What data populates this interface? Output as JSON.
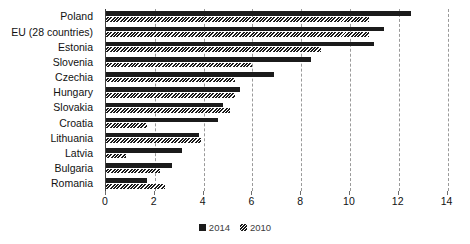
{
  "chart_data": {
    "type": "bar",
    "orientation": "horizontal",
    "title": "",
    "subtitle": "",
    "xlabel": "",
    "ylabel": "",
    "xlim": [
      0,
      14
    ],
    "xticks": [
      0,
      2,
      4,
      6,
      8,
      10,
      12,
      14
    ],
    "xtick_labels": [
      "0",
      "2",
      "4",
      "6",
      "8",
      "10",
      "12",
      "14"
    ],
    "grid": "vertical-dashed",
    "legend_position": "bottom-center",
    "categories": [
      "Poland",
      "EU (28 countries)",
      "Estonia",
      "Slovenia",
      "Czechia",
      "Hungary",
      "Slovakia",
      "Croatia",
      "Lithuania",
      "Latvia",
      "Bulgaria",
      "Romania"
    ],
    "series": [
      {
        "name": "2014",
        "color": "#1b1b1b",
        "values": [
          12.5,
          11.4,
          11.0,
          8.4,
          6.9,
          5.5,
          4.8,
          4.6,
          3.8,
          3.1,
          2.7,
          1.7
        ]
      },
      {
        "name": "2010",
        "color": "#2a2a2a",
        "pattern": "hatched",
        "values": [
          10.8,
          10.8,
          8.8,
          6.0,
          5.3,
          5.3,
          5.1,
          1.7,
          3.9,
          0.8,
          2.2,
          2.4
        ]
      }
    ]
  },
  "legend": {
    "items": [
      {
        "label": "2014",
        "swatch": "solid-black-square"
      },
      {
        "label": "2010",
        "swatch": "hatched-square"
      }
    ]
  }
}
